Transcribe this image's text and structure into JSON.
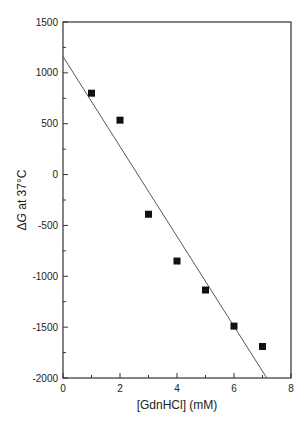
{
  "chart_data": {
    "type": "scatter",
    "title": "",
    "xlabel": "[GdnHCl] (mM)",
    "ylabel_prefix": "Δ",
    "ylabel_italic": "G",
    "ylabel_suffix": " at 37°C",
    "ylabel": "ΔG at 37°C",
    "xlim": [
      0,
      8
    ],
    "ylim": [
      -2000,
      1500
    ],
    "xticks": [
      0,
      2,
      4,
      6,
      8
    ],
    "xminor": [
      1,
      3,
      5,
      7
    ],
    "yticks": [
      -2000,
      -1500,
      -1000,
      -500,
      0,
      500,
      1000,
      1500
    ],
    "yminor": [
      -1750,
      -1250,
      -750,
      -250,
      250,
      750,
      1250
    ],
    "grid": false,
    "legend": null,
    "series": [
      {
        "name": "data",
        "marker": "square",
        "color": "#111111",
        "x": [
          1,
          2,
          3,
          4,
          5,
          6,
          7
        ],
        "y": [
          800,
          535,
          -390,
          -850,
          -1135,
          -1490,
          -1690
        ]
      },
      {
        "name": "linear fit",
        "kind": "line",
        "color": "#444444",
        "x": [
          0,
          7.15
        ],
        "y": [
          1160,
          -2000
        ]
      }
    ]
  }
}
